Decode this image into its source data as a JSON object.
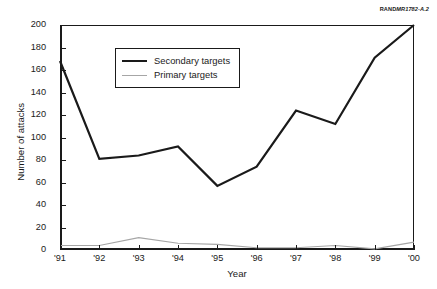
{
  "credit": {
    "brand": "RAND",
    "code": "MR1782-A.2"
  },
  "chart_data": {
    "type": "line",
    "title": "",
    "xlabel": "Year",
    "ylabel": "Number of attacks",
    "categories": [
      "'91",
      "'92",
      "'93",
      "'94",
      "'95",
      "'96",
      "'97",
      "'98",
      "'99",
      "'00"
    ],
    "ylim": [
      0,
      200
    ],
    "yticks": [
      0,
      20,
      40,
      60,
      80,
      100,
      120,
      140,
      160,
      180,
      200
    ],
    "ytick_labels": [
      "0",
      "20",
      "40",
      "60",
      "80",
      "100",
      "120",
      "140",
      "160",
      "180",
      "200"
    ],
    "grid": false,
    "legend_position": "upper-left-inside",
    "series": [
      {
        "name": "Secondary targets",
        "color": "#1a1a1a",
        "width": 2.2,
        "values": [
          168,
          81,
          84,
          92,
          57,
          74,
          124,
          112,
          171,
          200
        ]
      },
      {
        "name": "Primary targets",
        "color": "#a6a6a6",
        "width": 1.2,
        "values": [
          4,
          4,
          11,
          6,
          5,
          2,
          2,
          4,
          1,
          7
        ]
      }
    ]
  },
  "legend": {
    "items": [
      {
        "label": "Secondary targets"
      },
      {
        "label": "Primary targets"
      }
    ]
  }
}
